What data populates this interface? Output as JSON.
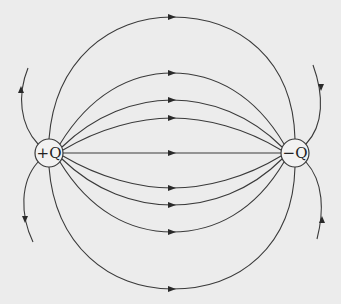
{
  "diagram": {
    "type": "electric dipole field lines",
    "background_color": "#ececec",
    "line_color": "#3a3a3a",
    "charges": [
      {
        "label": "+Q",
        "sign": "positive",
        "cx": 49,
        "cy": 153
      },
      {
        "label": "−Q",
        "sign": "negative",
        "cx": 295,
        "cy": 153
      }
    ],
    "field_line_arrow_direction": "from +Q to -Q",
    "inner_field_lines_count": 9,
    "outer_escaping_lines_count": 4
  }
}
